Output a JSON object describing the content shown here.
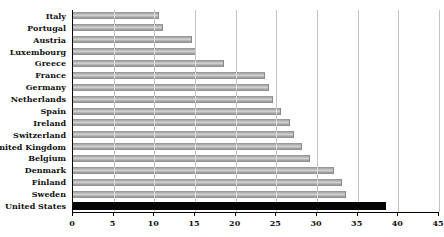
{
  "chart_data": {
    "type": "bar",
    "orientation": "horizontal",
    "title": "Percent of Adult Population",
    "categories": [
      "Italy",
      "Portugal",
      "Austria",
      "Luxembourg",
      "Greece",
      "France",
      "Germany",
      "Netherlands",
      "Spain",
      "Ireland",
      "Switzerland",
      "United Kingdom",
      "Belgium",
      "Denmark",
      "Finland",
      "Sweden",
      "United States"
    ],
    "values": [
      10.5,
      11,
      14.5,
      15,
      18.5,
      23.5,
      24,
      24.5,
      25.5,
      26.5,
      27,
      28,
      29,
      32,
      33,
      33.5,
      38.5
    ],
    "xlim": [
      0,
      45
    ],
    "xticks": [
      0,
      5,
      10,
      15,
      20,
      25,
      30,
      35,
      40,
      45
    ],
    "grid": "vertical",
    "legend": "none",
    "highlight_category": "United States",
    "bar_color": "#a9a9a9",
    "highlight_color": "#000000",
    "gridline_color": "#7a7a7a",
    "axis_color": "#000000",
    "background_color": "#ffffff"
  }
}
